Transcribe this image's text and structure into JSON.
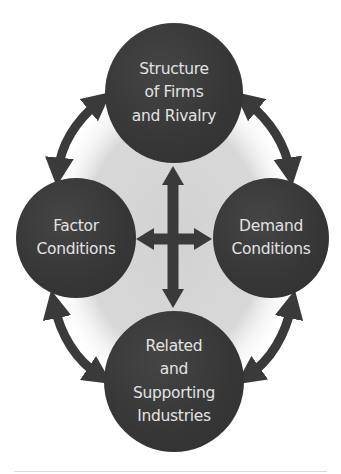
{
  "diagram": {
    "colors": {
      "node_fill": "#363636",
      "node_text": "#e2e2e2",
      "arrow": "#3a3a3a",
      "inner_background": "#d6d6d6",
      "page_background": "#ffffff"
    },
    "nodes": {
      "top": {
        "lines": [
          "Structure",
          "of Firms",
          "and Rivalry"
        ]
      },
      "left": {
        "lines": [
          "Factor",
          "Conditions"
        ]
      },
      "right": {
        "lines": [
          "Demand",
          "Conditions"
        ]
      },
      "bottom": {
        "lines": [
          "Related",
          "and",
          "Supporting",
          "Industries"
        ]
      }
    },
    "connections": [
      {
        "from": "top",
        "to": "left",
        "type": "curved-double-arrow"
      },
      {
        "from": "top",
        "to": "right",
        "type": "curved-double-arrow"
      },
      {
        "from": "left",
        "to": "bottom",
        "type": "curved-double-arrow"
      },
      {
        "from": "right",
        "to": "bottom",
        "type": "curved-double-arrow"
      },
      {
        "from": "top",
        "to": "bottom",
        "type": "straight-double-arrow"
      },
      {
        "from": "left",
        "to": "right",
        "type": "straight-double-arrow"
      }
    ]
  }
}
